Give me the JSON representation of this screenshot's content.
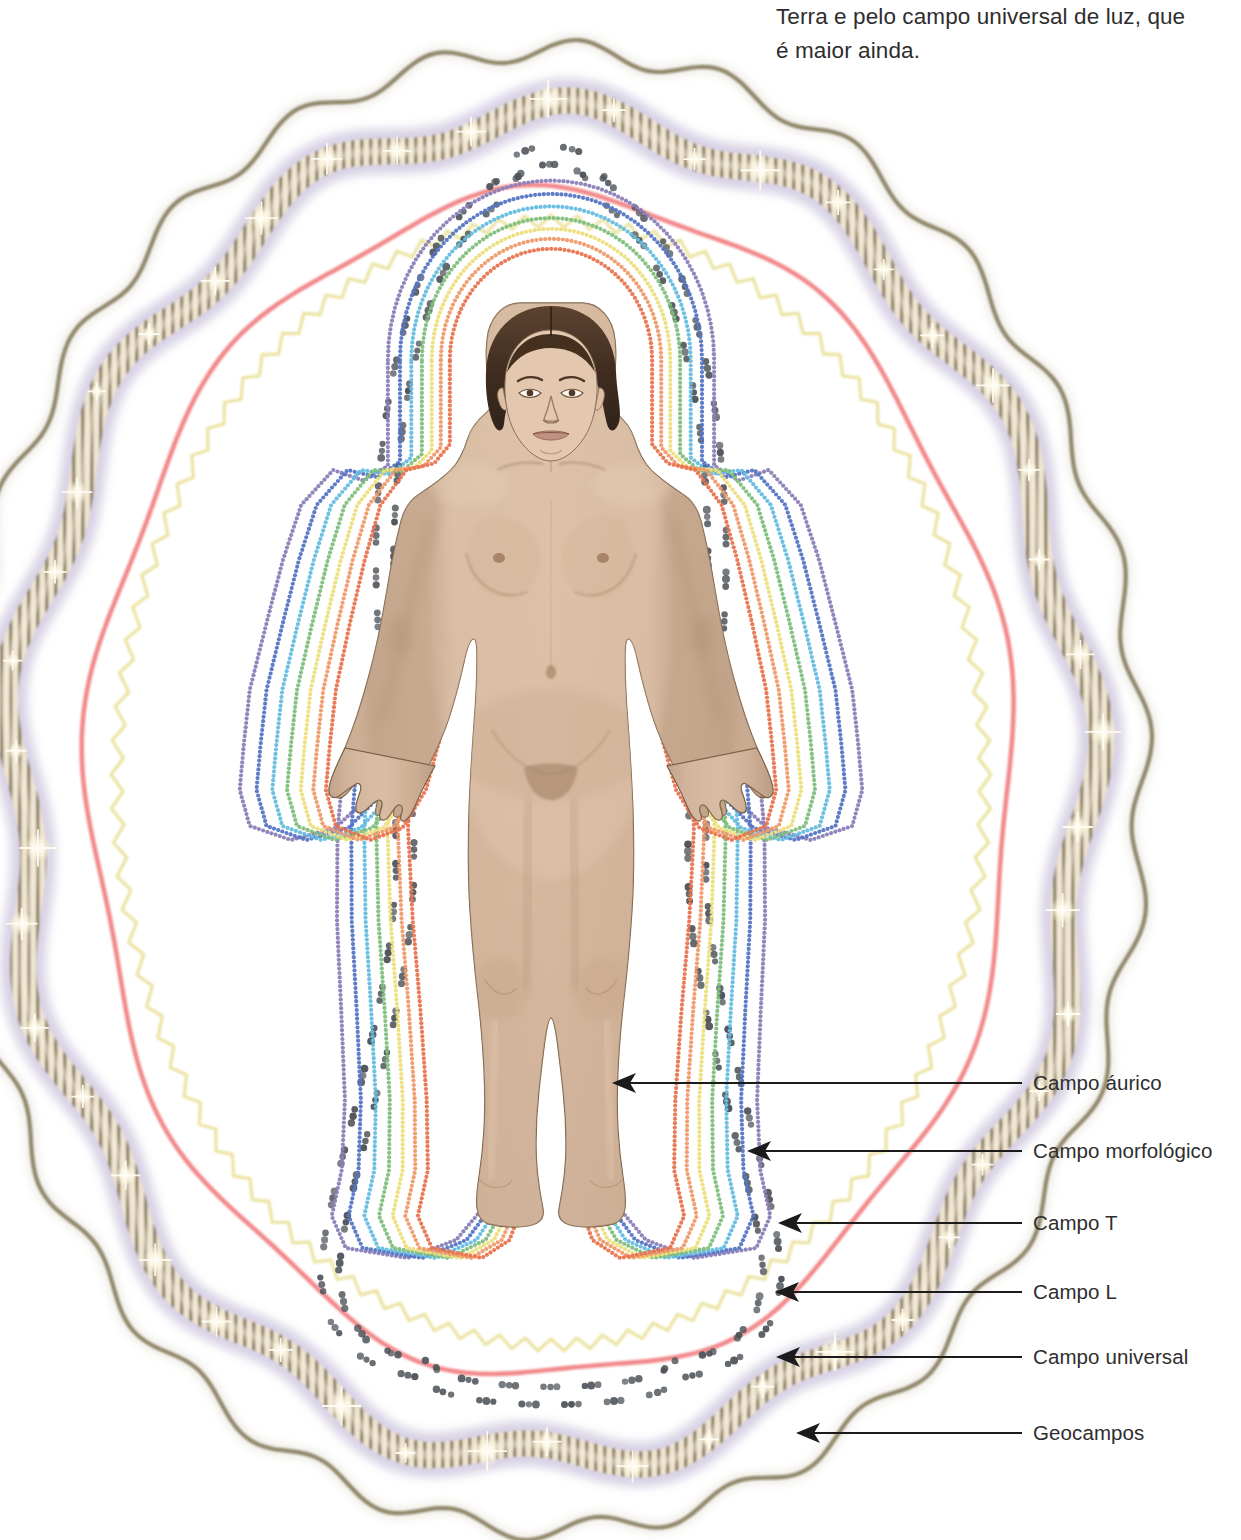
{
  "caption": {
    "line1": "Terra e pelo campo universal de luz, que",
    "line2": "é maior ainda."
  },
  "figure": {
    "skin_color": "#cdb199",
    "hair_color": "#4a3426",
    "outline_color": "#6b5340"
  },
  "labels": [
    {
      "id": "campo-aurico",
      "text": "Campo áurico",
      "y": 1083,
      "arrow_to_x": 600,
      "arrow_to_y": 1083
    },
    {
      "id": "campo-morfologico",
      "text": "Campo morfológico",
      "y": 1151,
      "arrow_to_x": 735,
      "arrow_to_y": 1151
    },
    {
      "id": "campo-t",
      "text": "Campo T",
      "y": 1223,
      "arrow_to_x": 766,
      "arrow_to_y": 1223
    },
    {
      "id": "campo-l",
      "text": "Campo L",
      "y": 1292,
      "arrow_to_x": 763,
      "arrow_to_y": 1292
    },
    {
      "id": "campo-universal",
      "text": "Campo universal",
      "y": 1357,
      "arrow_to_x": 764,
      "arrow_to_y": 1357
    },
    {
      "id": "geocampos",
      "text": "Geocampos",
      "y": 1433,
      "arrow_to_x": 784,
      "arrow_to_y": 1433
    }
  ],
  "field_layers": [
    {
      "id": "aura-red",
      "name": "Aura layer 1 (red)",
      "color": "#e8744f",
      "style": "dotted-contour",
      "order": 1
    },
    {
      "id": "aura-orange",
      "name": "Aura layer 2 (orange)",
      "color": "#ef9a6a",
      "style": "dotted-contour",
      "order": 2
    },
    {
      "id": "aura-yellow",
      "name": "Aura layer 3 (yellow)",
      "color": "#ecdf7c",
      "style": "dotted-contour",
      "order": 3
    },
    {
      "id": "aura-green",
      "name": "Aura layer 4 (green)",
      "color": "#7fbf7c",
      "style": "dotted-contour",
      "order": 4
    },
    {
      "id": "aura-cyan",
      "name": "Aura layer 5 (cyan)",
      "color": "#66bde2",
      "style": "dotted-contour",
      "order": 5
    },
    {
      "id": "aura-blue",
      "name": "Aura layer 6 (blue)",
      "color": "#5575c4",
      "style": "dotted-contour",
      "order": 6
    },
    {
      "id": "aura-violet",
      "name": "Aura layer 7 (violet)",
      "color": "#8a7fb8",
      "style": "dotted-contour",
      "order": 7
    },
    {
      "id": "morphic",
      "name": "Campo morfológico",
      "color": "#4a5055",
      "style": "dotted-zigzag",
      "order": 8
    },
    {
      "id": "field-t",
      "name": "Campo T",
      "color": "#f0ecb4",
      "style": "zigzag-wave",
      "order": 9
    },
    {
      "id": "field-l",
      "name": "Campo L",
      "color": "#f2888a",
      "style": "smooth-wave",
      "order": 10
    },
    {
      "id": "field-universal",
      "name": "Campo universal",
      "color": "#a99ec4",
      "style": "striped-sparkle",
      "order": 11
    },
    {
      "id": "geofields",
      "name": "Geocampos",
      "color": "#7d7355",
      "style": "scalloped-wave",
      "order": 12
    }
  ]
}
